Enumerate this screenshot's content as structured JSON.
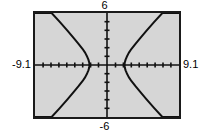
{
  "screen": {
    "title": "graphing-calculator-viewport",
    "background_color": "#ffffff",
    "plot_background_color": "#d6d6d6",
    "frame_color": "#1a1a1a",
    "curve_color": "#111111"
  },
  "labels": {
    "ymax": "6",
    "ymin": "-6",
    "xmin": "-9.1",
    "xmax": "9.1"
  },
  "chart_data": {
    "type": "line",
    "title": "",
    "xlabel": "",
    "ylabel": "",
    "xlim": [
      -9.1,
      9.1
    ],
    "ylim": [
      -6,
      6
    ],
    "grid": false,
    "legend": null,
    "axis_tick_spacing_x": 1,
    "axis_tick_spacing_y": 1,
    "x_tick_labels": [
      "-9.1",
      "9.1"
    ],
    "y_tick_labels": [
      "6",
      "-6"
    ],
    "annotations": [],
    "series": [
      {
        "name": "left-branch-upper",
        "comment": "hyperbola x^2/a^2 - y^2/b^2 = 1, a=2.2, b=1.75, left branch upper half",
        "x": [
          -2.2,
          -2.25,
          -2.35,
          -2.5,
          -2.75,
          -3.1,
          -3.6,
          -4.2,
          -5.0,
          -6.0,
          -7.0,
          -8.0,
          -9.1
        ],
        "y": [
          0.0,
          0.3,
          0.62,
          0.95,
          1.4,
          1.87,
          2.45,
          3.1,
          3.96,
          5.0,
          6.0,
          6.0,
          6.0
        ]
      },
      {
        "name": "left-branch-lower",
        "x": [
          -2.2,
          -2.25,
          -2.35,
          -2.5,
          -2.75,
          -3.1,
          -3.6,
          -4.2,
          -5.0,
          -6.0,
          -7.0,
          -8.0,
          -9.1
        ],
        "y": [
          0.0,
          -0.3,
          -0.62,
          -0.95,
          -1.4,
          -1.87,
          -2.45,
          -3.1,
          -3.96,
          -5.0,
          -6.0,
          -6.0,
          -6.0
        ]
      },
      {
        "name": "right-branch-upper",
        "x": [
          2.2,
          2.25,
          2.35,
          2.5,
          2.75,
          3.1,
          3.6,
          4.2,
          5.0,
          6.0,
          7.0,
          8.0,
          9.1
        ],
        "y": [
          0.0,
          0.3,
          0.62,
          0.95,
          1.4,
          1.87,
          2.45,
          3.1,
          3.96,
          5.0,
          6.0,
          6.0,
          6.0
        ]
      },
      {
        "name": "right-branch-lower",
        "x": [
          2.2,
          2.25,
          2.35,
          2.5,
          2.75,
          3.1,
          3.6,
          4.2,
          5.0,
          6.0,
          7.0,
          8.0,
          9.1
        ],
        "y": [
          0.0,
          -0.3,
          -0.62,
          -0.95,
          -1.4,
          -1.87,
          -2.45,
          -3.1,
          -3.96,
          -5.0,
          -6.0,
          -6.0,
          -6.0
        ]
      }
    ]
  }
}
